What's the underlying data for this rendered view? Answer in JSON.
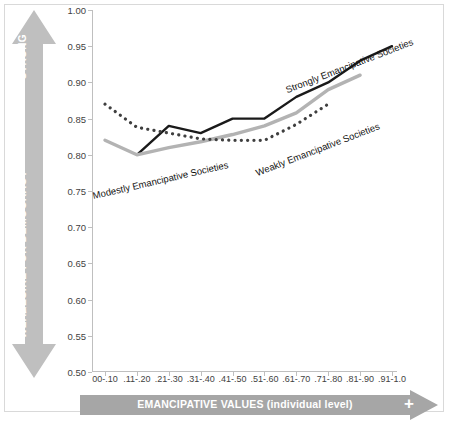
{
  "chart_data": {
    "type": "line",
    "title": "",
    "xlabel": "EMANCIPATIVE VALUES (individual level)",
    "ylabel": "DESIRE FOR DEMOCRACY",
    "categories": [
      "00-.10",
      ".11-.20",
      ".21-.30",
      ".31-.40",
      ".41-.50",
      ".51-.60",
      ".61-.70",
      ".71-.80",
      ".81-.90",
      ".91-1.0"
    ],
    "ylim": [
      0.5,
      1.0
    ],
    "ytick_labels": [
      "1.00",
      "0.95",
      "0.90",
      "0.85",
      "0.80",
      "0.75",
      "0.70",
      "0.65",
      "0.60",
      "0.55",
      "0.50"
    ],
    "ytick_values": [
      1.0,
      0.95,
      0.9,
      0.85,
      0.8,
      0.75,
      0.7,
      0.65,
      0.6,
      0.55,
      0.5
    ],
    "grid": false,
    "legend": "inline-annotations",
    "series": [
      {
        "name": "Strongly Emancipative Societies",
        "style": "solid",
        "color": "#1a1a1a",
        "x": [
          ".11-.20",
          ".21-.30",
          ".31-.40",
          ".41-.50",
          ".51-.60",
          ".61-.70",
          ".71-.80",
          ".81-.90",
          ".91-1.0"
        ],
        "values": [
          0.8,
          0.84,
          0.83,
          0.85,
          0.85,
          0.88,
          0.9,
          0.93,
          0.95
        ]
      },
      {
        "name": "Modestly Emancipative Societies",
        "style": "solid",
        "color": "#b3b3b3",
        "x": [
          "00-.10",
          ".11-.20",
          ".21-.30",
          ".31-.40",
          ".41-.50",
          ".51-.60",
          ".61-.70",
          ".71-.80",
          ".81-.90"
        ],
        "values": [
          0.82,
          0.8,
          0.81,
          0.818,
          0.828,
          0.84,
          0.858,
          0.89,
          0.91
        ]
      },
      {
        "name": "Weakly Emancipative Societies",
        "style": "dotted",
        "color": "#3f3f3f",
        "x": [
          "00-.10",
          ".11-.20",
          ".21-.30",
          ".31-.40",
          ".41-.50",
          ".51-.60",
          ".61-.70",
          ".71-.80"
        ],
        "values": [
          0.87,
          0.838,
          0.83,
          0.822,
          0.82,
          0.82,
          0.842,
          0.87
        ]
      }
    ],
    "annotations": [
      {
        "text": "Strongly Emancipative Societies",
        "series": "Strongly Emancipative Societies"
      },
      {
        "text": "Modestly Emancipative Societies",
        "series": "Modestly Emancipative Societies"
      },
      {
        "text": "Weakly Emancipative Societies",
        "series": "Weakly Emancipative Societies"
      }
    ]
  },
  "axes": {
    "y_arrow": {
      "top_label": "STRONG",
      "mid_label": "DESIRE FOR DEMOCRACY",
      "bottom_label": "WEAK",
      "color": "#bfbfbf"
    },
    "x_arrow": {
      "label": "EMANCIPATIVE VALUES (individual level)",
      "end_glyph": "+",
      "color": "#a6a6a6"
    }
  },
  "colors": {
    "frame": "#d9d9d9",
    "axis": "#bfbfbf",
    "tick_text": "#3f3f3f",
    "series_black": "#1a1a1a",
    "series_gray": "#b3b3b3",
    "series_dotted": "#3f3f3f",
    "arrow_gray": "#bfbfbf"
  }
}
